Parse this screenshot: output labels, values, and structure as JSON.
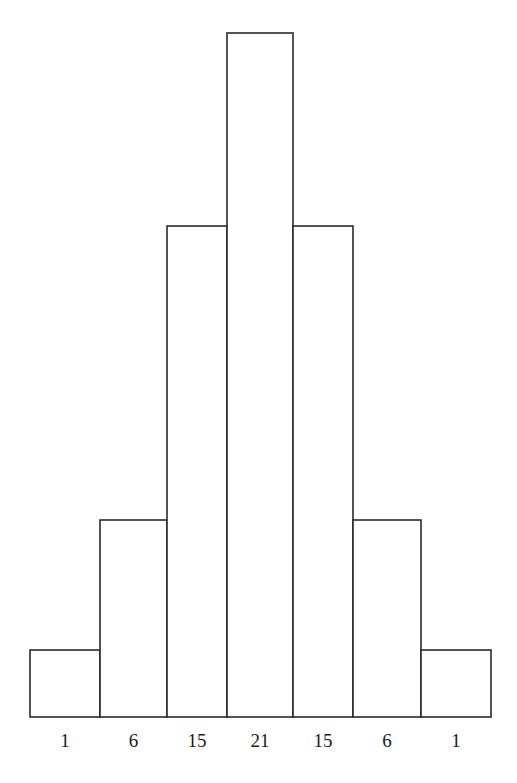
{
  "chart_data": {
    "type": "bar",
    "title": "",
    "xlabel": "",
    "ylabel": "",
    "categories": [
      "1",
      "6",
      "15",
      "21",
      "15",
      "6",
      "1"
    ],
    "values": [
      1,
      6,
      15,
      21,
      15,
      6,
      1
    ],
    "grid": false,
    "legend": "none",
    "bar_color": "#ffffff",
    "edge_color": "#2a2a2a"
  }
}
